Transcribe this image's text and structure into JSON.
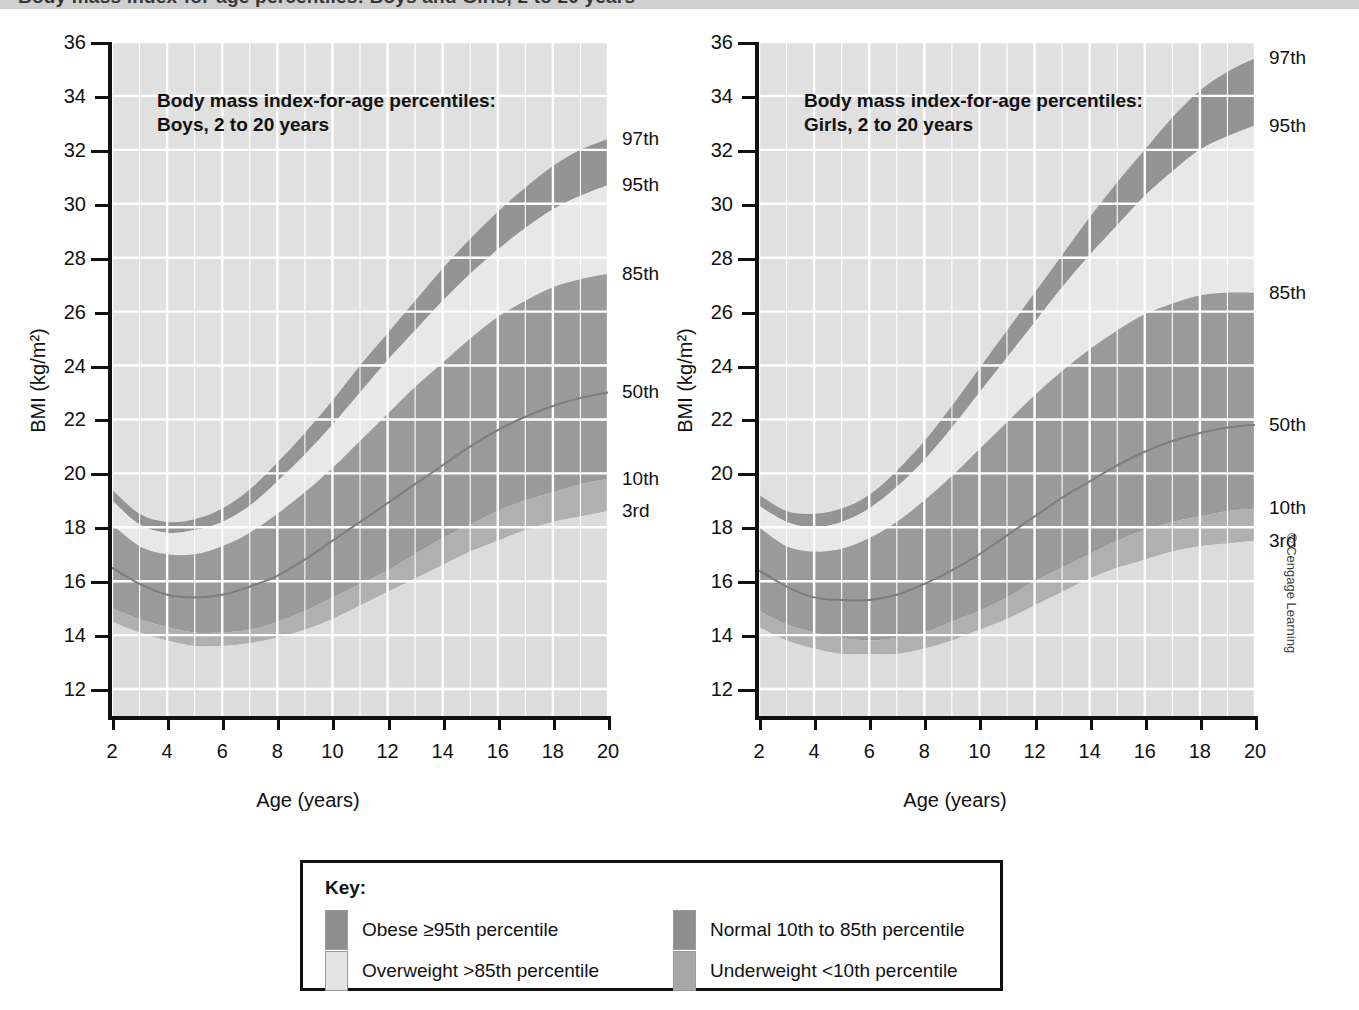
{
  "banner": {
    "cropped_text": "Body mass index-for-age percentiles: Boys and Girls, 2 to 20 years"
  },
  "credit": "© Cengage Learning",
  "key": {
    "title": "Key:",
    "items": [
      {
        "label": "Obese ≥95th percentile",
        "color": "#8e8e8e"
      },
      {
        "label": "Overweight >85th percentile",
        "color": "#e3e3e3"
      },
      {
        "label": "Normal 10th to 85th percentile",
        "color": "#8e8e8e"
      },
      {
        "label": "Underweight <10th percentile",
        "color": "#a8a8a8"
      }
    ]
  },
  "chart_data": [
    {
      "type": "area",
      "id": "boys",
      "title": "Body mass index-for-age percentiles:\nBoys, 2 to 20 years",
      "xlabel": "Age (years)",
      "ylabel": "BMI (kg/m²)",
      "xlim": [
        2,
        20
      ],
      "ylim": [
        11,
        36
      ],
      "xticks": [
        2,
        4,
        6,
        8,
        10,
        12,
        14,
        16,
        18,
        20
      ],
      "yticks": [
        12,
        14,
        16,
        18,
        20,
        22,
        24,
        26,
        28,
        30,
        32,
        34,
        36
      ],
      "grid": true,
      "x": [
        2,
        3,
        4,
        5,
        6,
        7,
        8,
        9,
        10,
        11,
        12,
        13,
        14,
        15,
        16,
        17,
        18,
        19,
        20
      ],
      "series": [
        {
          "name": "97th",
          "end_label": "97th",
          "values": [
            19.4,
            18.5,
            18.2,
            18.3,
            18.7,
            19.4,
            20.4,
            21.5,
            22.7,
            24.0,
            25.2,
            26.4,
            27.6,
            28.7,
            29.7,
            30.6,
            31.4,
            32.0,
            32.4
          ]
        },
        {
          "name": "95th",
          "end_label": "95th",
          "values": [
            19.0,
            18.1,
            17.8,
            17.9,
            18.2,
            18.8,
            19.7,
            20.7,
            21.8,
            23.0,
            24.2,
            25.3,
            26.4,
            27.4,
            28.3,
            29.1,
            29.8,
            30.3,
            30.7
          ]
        },
        {
          "name": "85th",
          "end_label": "85th",
          "values": [
            18.1,
            17.3,
            17.0,
            17.0,
            17.3,
            17.8,
            18.5,
            19.3,
            20.2,
            21.2,
            22.2,
            23.2,
            24.1,
            25.0,
            25.8,
            26.4,
            26.9,
            27.2,
            27.4
          ]
        },
        {
          "name": "50th",
          "end_label": "50th",
          "values": [
            16.5,
            15.9,
            15.5,
            15.4,
            15.5,
            15.8,
            16.2,
            16.8,
            17.5,
            18.2,
            18.9,
            19.6,
            20.3,
            21.0,
            21.6,
            22.1,
            22.5,
            22.8,
            23.0
          ]
        },
        {
          "name": "10th",
          "end_label": "10th",
          "values": [
            15.0,
            14.6,
            14.3,
            14.1,
            14.1,
            14.2,
            14.5,
            14.9,
            15.4,
            15.9,
            16.4,
            17.0,
            17.6,
            18.1,
            18.6,
            19.0,
            19.3,
            19.6,
            19.8
          ]
        },
        {
          "name": "3rd",
          "end_label": "3rd",
          "values": [
            14.5,
            14.1,
            13.8,
            13.6,
            13.6,
            13.7,
            13.9,
            14.2,
            14.6,
            15.1,
            15.6,
            16.1,
            16.6,
            17.1,
            17.5,
            17.9,
            18.2,
            18.4,
            18.6
          ]
        }
      ]
    },
    {
      "type": "area",
      "id": "girls",
      "title": "Body mass index-for-age percentiles:\nGirls, 2 to 20 years",
      "xlabel": "Age (years)",
      "ylabel": "BMI (kg/m²)",
      "xlim": [
        2,
        20
      ],
      "ylim": [
        11,
        36
      ],
      "xticks": [
        2,
        4,
        6,
        8,
        10,
        12,
        14,
        16,
        18,
        20
      ],
      "yticks": [
        12,
        14,
        16,
        18,
        20,
        22,
        24,
        26,
        28,
        30,
        32,
        34,
        36
      ],
      "grid": true,
      "x": [
        2,
        3,
        4,
        5,
        6,
        7,
        8,
        9,
        10,
        11,
        12,
        13,
        14,
        15,
        16,
        17,
        18,
        19,
        20
      ],
      "series": [
        {
          "name": "97th",
          "end_label": "97th",
          "values": [
            19.2,
            18.6,
            18.5,
            18.7,
            19.2,
            20.1,
            21.2,
            22.5,
            23.9,
            25.3,
            26.7,
            28.1,
            29.5,
            30.8,
            32.0,
            33.2,
            34.2,
            34.9,
            35.4
          ]
        },
        {
          "name": "95th",
          "end_label": "95th",
          "values": [
            18.8,
            18.2,
            18.0,
            18.2,
            18.7,
            19.5,
            20.5,
            21.7,
            23.0,
            24.3,
            25.6,
            26.9,
            28.1,
            29.2,
            30.3,
            31.2,
            32.0,
            32.5,
            32.9
          ]
        },
        {
          "name": "85th",
          "end_label": "85th",
          "values": [
            18.0,
            17.3,
            17.1,
            17.2,
            17.6,
            18.2,
            19.0,
            19.9,
            20.9,
            21.9,
            22.9,
            23.8,
            24.6,
            25.3,
            25.9,
            26.3,
            26.6,
            26.7,
            26.7
          ]
        },
        {
          "name": "50th",
          "end_label": "50th",
          "values": [
            16.4,
            15.8,
            15.4,
            15.3,
            15.3,
            15.5,
            15.9,
            16.4,
            17.0,
            17.7,
            18.4,
            19.1,
            19.7,
            20.3,
            20.8,
            21.2,
            21.5,
            21.7,
            21.8
          ]
        },
        {
          "name": "10th",
          "end_label": "10th",
          "values": [
            14.9,
            14.4,
            14.1,
            13.9,
            13.8,
            13.9,
            14.1,
            14.5,
            14.9,
            15.4,
            16.0,
            16.5,
            17.0,
            17.5,
            17.9,
            18.2,
            18.4,
            18.6,
            18.7
          ]
        },
        {
          "name": "3rd",
          "end_label": "3rd",
          "values": [
            14.3,
            13.8,
            13.5,
            13.3,
            13.3,
            13.3,
            13.5,
            13.8,
            14.2,
            14.6,
            15.1,
            15.6,
            16.1,
            16.5,
            16.8,
            17.1,
            17.3,
            17.4,
            17.5
          ]
        }
      ]
    }
  ],
  "band_colors": {
    "background": "#e0e0e0",
    "above_97": "#e0e0e0",
    "obese_band": "#949494",
    "overweight_band": "#e8e8e8",
    "normal_band": "#9a9a9a",
    "underweight_band": "#b0b0b0",
    "below_3rd": "#dcdcdc",
    "gridline": "#ffffff",
    "curve": "#7d7d7d",
    "axis": "#111111"
  }
}
